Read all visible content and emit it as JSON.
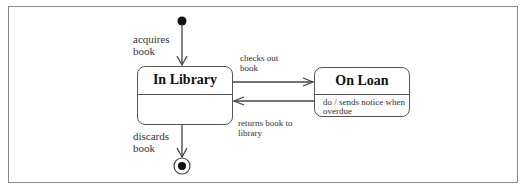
{
  "diagram": {
    "type": "uml-state-machine",
    "states": [
      {
        "id": "in_library",
        "name": "In Library",
        "activity": ""
      },
      {
        "id": "on_loan",
        "name": "On Loan",
        "activity": "do / sends notice when\noverdue"
      }
    ],
    "pseudostates": [
      {
        "id": "initial",
        "kind": "initial"
      },
      {
        "id": "final",
        "kind": "final"
      }
    ],
    "transitions": [
      {
        "from": "initial",
        "to": "in_library",
        "label": "acquires\nbook"
      },
      {
        "from": "in_library",
        "to": "on_loan",
        "label": "checks out\nbook"
      },
      {
        "from": "on_loan",
        "to": "in_library",
        "label": "returns book to\nlibrary"
      },
      {
        "from": "in_library",
        "to": "final",
        "label": "discards\nbook"
      }
    ],
    "colors": {
      "line": "#444444",
      "frame": "#8a8a8a",
      "text": "#333333"
    }
  }
}
